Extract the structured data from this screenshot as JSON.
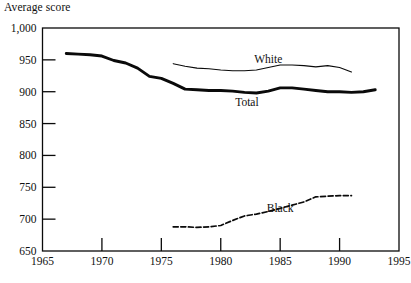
{
  "chart_data": {
    "type": "line",
    "title": "Average score",
    "ylabel": "Average score",
    "xlabel": "",
    "xlim": [
      1965,
      1995
    ],
    "ylim": [
      650,
      1000
    ],
    "grid": false,
    "legend_position": "inline-annotations",
    "x_tick_labels": [
      "1965",
      "1970",
      "1975",
      "1980",
      "1985",
      "1990",
      "1995"
    ],
    "x_ticks": [
      1965,
      1970,
      1975,
      1980,
      1985,
      1990,
      1995
    ],
    "y_tick_labels": [
      "650",
      "700",
      "750",
      "800",
      "850",
      "900",
      "950",
      "1,000"
    ],
    "y_ticks": [
      650,
      700,
      750,
      800,
      850,
      900,
      950,
      1000
    ],
    "series": [
      {
        "name": "Total",
        "style": "solid-thick",
        "color": "#0a0a0a",
        "width": 2.9,
        "label_x": 1982.2,
        "label_y": 884,
        "x": [
          1967,
          1968,
          1969,
          1970,
          1971,
          1972,
          1973,
          1974,
          1975,
          1976,
          1977,
          1978,
          1979,
          1980,
          1981,
          1982,
          1983,
          1984,
          1985,
          1986,
          1987,
          1988,
          1989,
          1990,
          1991,
          1992,
          1993
        ],
        "values": [
          960,
          959,
          958,
          956,
          949,
          945,
          937,
          924,
          921,
          913,
          904,
          903,
          902,
          902,
          901,
          899,
          898,
          901,
          906,
          906,
          904,
          902,
          900,
          900,
          899,
          900,
          903
        ]
      },
      {
        "name": "White",
        "style": "solid-thin",
        "color": "#0a0a0a",
        "width": 1.1,
        "label_x": 1984.0,
        "label_y": 951,
        "x": [
          1976,
          1977,
          1978,
          1979,
          1980,
          1981,
          1982,
          1983,
          1984,
          1985,
          1986,
          1987,
          1988,
          1989,
          1990,
          1991
        ],
        "values": [
          944,
          940,
          937,
          936,
          934,
          933,
          933,
          934,
          938,
          942,
          942,
          941,
          939,
          941,
          938,
          931
        ]
      },
      {
        "name": "Black",
        "style": "dashed",
        "color": "#0a0a0a",
        "width": 1.7,
        "label_x": 1985.0,
        "label_y": 717,
        "x": [
          1976,
          1977,
          1978,
          1979,
          1980,
          1981,
          1982,
          1983,
          1984,
          1985,
          1986,
          1987,
          1988,
          1989,
          1990,
          1991
        ],
        "values": [
          688,
          688,
          687,
          688,
          690,
          698,
          705,
          708,
          712,
          717,
          722,
          727,
          735,
          736,
          737,
          737
        ]
      }
    ]
  }
}
